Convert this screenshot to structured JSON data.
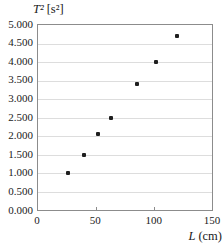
{
  "chart_data": {
    "type": "scatter",
    "title": {
      "text": "T² [s²]",
      "var": "T²",
      "unit": "[s²]"
    },
    "xlabel": {
      "text": "L (cm)",
      "var": "L",
      "unit": "(cm)"
    },
    "ylabel": "T² [s²]",
    "x": [
      26,
      40,
      52,
      63,
      85,
      102,
      120
    ],
    "y": [
      1.0,
      1.5,
      2.05,
      2.5,
      3.4,
      4.0,
      4.7
    ],
    "xlim": [
      0,
      150
    ],
    "ylim": [
      0,
      5.0
    ],
    "x_ticks": [
      0,
      50,
      100,
      150
    ],
    "x_tick_labels": [
      "0",
      "50",
      "100",
      "150"
    ],
    "y_ticks": [
      0,
      0.5,
      1,
      1.5,
      2,
      2.5,
      3,
      3.5,
      4,
      4.5,
      5
    ],
    "y_tick_labels": [
      "0.000",
      "0.500",
      "1.000",
      "1.500",
      "2.000",
      "2.500",
      "3.000",
      "3.500",
      "4.000",
      "4.500",
      "5.000"
    ],
    "grid": "horizontal-only",
    "legend": "none",
    "colors": {
      "background": "#ffffff",
      "marker": "#1f1f1f",
      "frame": "#8c8c8c",
      "gridline": "#dddddd",
      "text": "#1a1a1a"
    }
  }
}
